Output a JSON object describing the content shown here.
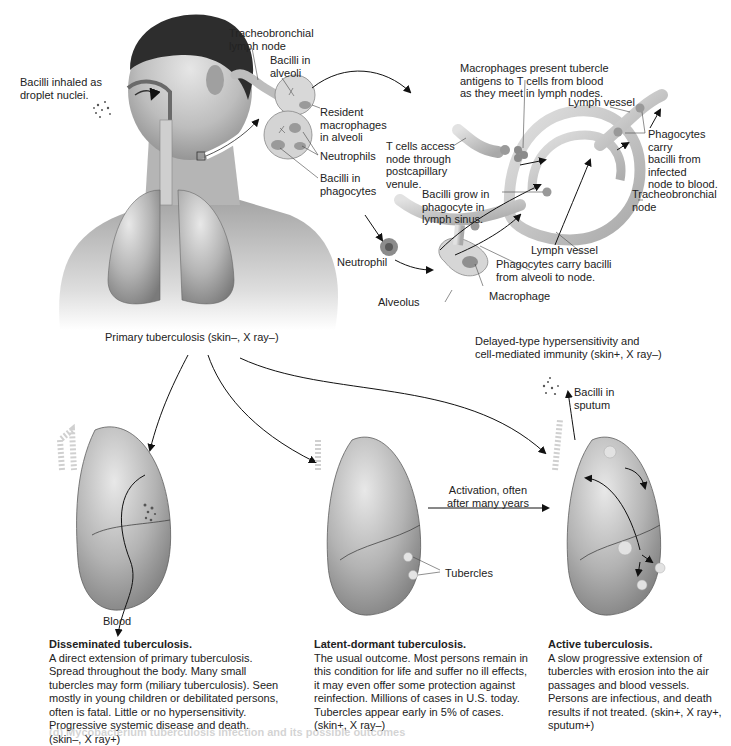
{
  "figure": {
    "panels": {
      "primary": {
        "caption": "Primary tuberculosis (skin–, X ray–)",
        "labels": {
          "inhaled": "Bacilli inhaled as\ndroplet nuclei.",
          "tracheobronchial_lymph_node": "Tracheobronchial\nlymph node",
          "bacilli_in_alveoli": "Bacilli in\nalveoli",
          "resident_macrophages": "Resident\nmacrophages\nin alveoli",
          "neutrophils": "Neutrophils",
          "bacilli_in_phagocytes": "Bacilli in\nphagocytes"
        }
      },
      "hypersensitivity": {
        "caption_line1": "Delayed-type hypersensitivity and",
        "caption_line2": "cell-mediated immunity (skin+, X ray–)",
        "labels": {
          "macrophages_present": "Macrophages present tubercle\nantigens to T cells from blood\nas they meet in lymph nodes.",
          "lymph_vessel_top": "Lymph vessel",
          "t_cells_access": "T cells access\nnode through\npostcapillary\nvenule.",
          "phagocytes_to_blood": "Phagocytes carry\nbacilli from\ninfected\nnode to blood.",
          "bacilli_grow": "Bacilli grow in\nphagocyte in\nlymph sinus.",
          "tracheobronchial_node": "Tracheobronchial\nnode",
          "neutrophil": "Neutrophil",
          "lymph_vessel_bottom": "Lymph vessel",
          "phagocytes_to_node": "Phagocytes carry bacilli\nfrom alveoli to node.",
          "alveolus": "Alveolus",
          "macrophage": "Macrophage"
        }
      },
      "disseminated": {
        "blood_label": "Blood",
        "title": "Disseminated tuberculosis.",
        "body": "A direct extension of primary tuberculosis. Spread throughout the body. Many small tubercles may form (miliary tuberculosis). Seen mostly in young children or debilitated persons, often is fatal. Little or no hypersensitivity. Progressive systemic disease and death. (skin–, X ray+)"
      },
      "latent": {
        "tubercles_label": "Tubercles",
        "activation_label": "Activation, often\nafter many years",
        "title": "Latent-dormant tuberculosis.",
        "body": "The usual outcome. Most persons remain in this condition for life and suffer no ill effects, it may even offer some protection against reinfection. Millions of cases in U.S. today. Tubercles appear early in 5% of cases. (skin+, X ray–)"
      },
      "active": {
        "sputum_label": "Bacilli in\nsputum",
        "title": "Active tuberculosis.",
        "body": "A slow progressive extension of tubercles with erosion into the air passages and blood vessels. Persons are infectious, and death results if not treated. (skin+, X ray+, sputum+)"
      }
    },
    "bleed_through_text": "(d) Mycobacterium tuberculosis infection and its possible outcomes"
  },
  "colors": {
    "skin_light": "#d8d8d8",
    "skin_dark": "#8a8a8a",
    "lung_light": "#c9c9c9",
    "lung_dark": "#7d7d7d",
    "vessel": "#bdbdbd",
    "text": "#222222",
    "arrow": "#111111"
  }
}
